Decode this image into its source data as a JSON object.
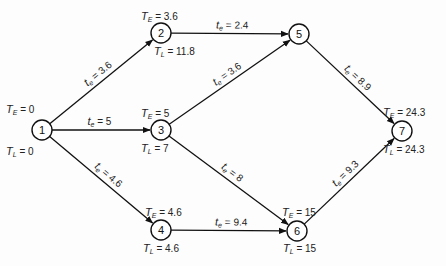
{
  "diagram": {
    "type": "PERT network",
    "nodes": [
      {
        "id": "1",
        "x": 42,
        "y": 130,
        "TE": "0",
        "TL": "0"
      },
      {
        "id": "2",
        "x": 161,
        "y": 33,
        "TE": "3.6",
        "TL": "11.8"
      },
      {
        "id": "3",
        "x": 161,
        "y": 130,
        "TE": "5",
        "TL": "7"
      },
      {
        "id": "4",
        "x": 161,
        "y": 230,
        "TE": "4.6",
        "TL": "4.6"
      },
      {
        "id": "5",
        "x": 299,
        "y": 34,
        "TE": "",
        "TL": ""
      },
      {
        "id": "6",
        "x": 297,
        "y": 231,
        "TE": "15",
        "TL": "15"
      },
      {
        "id": "7",
        "x": 402,
        "y": 131,
        "TE": "24.3",
        "TL": "24.3"
      }
    ],
    "edges": [
      {
        "from": "1",
        "to": "2",
        "te": "3.6"
      },
      {
        "from": "1",
        "to": "3",
        "te": "5"
      },
      {
        "from": "1",
        "to": "4",
        "te": "4.6"
      },
      {
        "from": "2",
        "to": "5",
        "te": "2.4"
      },
      {
        "from": "3",
        "to": "5",
        "te": "3.6"
      },
      {
        "from": "3",
        "to": "6",
        "te": "8"
      },
      {
        "from": "4",
        "to": "6",
        "te": "9.4"
      },
      {
        "from": "5",
        "to": "7",
        "te": "8.9"
      },
      {
        "from": "6",
        "to": "7",
        "te": "9.3"
      }
    ],
    "labels": {
      "te_symbol": "t",
      "te_sub": "e",
      "TE_symbol": "T",
      "TE_sub": "E",
      "TL_symbol": "T",
      "TL_sub": "L",
      "equals": " = "
    }
  }
}
